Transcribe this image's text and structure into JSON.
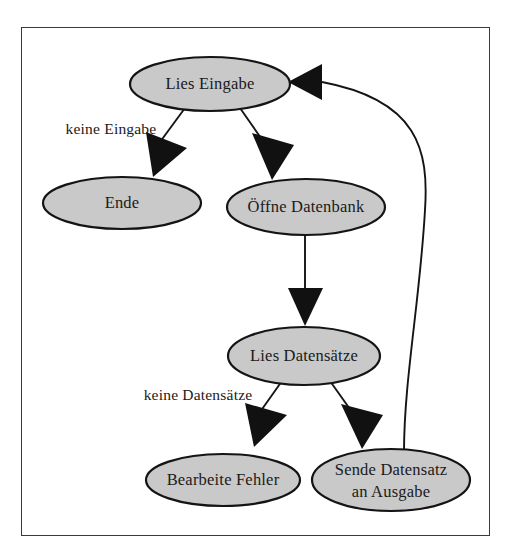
{
  "diagram": {
    "type": "flowchart",
    "language": "de",
    "frame": {
      "border_color": "#3a3a3a",
      "background": "#ffffff"
    },
    "style": {
      "node_fill": "#c9c9c9",
      "node_stroke": "#141414",
      "edge_color": "#141414",
      "text_color": "#1a1a1a"
    },
    "nodes": [
      {
        "id": "lies-eingabe",
        "label": "Lies Eingabe",
        "cx": 210,
        "cy": 84,
        "rx": 80,
        "ry": 27
      },
      {
        "id": "ende",
        "label": "Ende",
        "cx": 122,
        "cy": 203,
        "rx": 79,
        "ry": 26
      },
      {
        "id": "oeffne-datenbank",
        "label": "Öffne Datenbank",
        "cx": 306,
        "cy": 207,
        "rx": 79,
        "ry": 28
      },
      {
        "id": "lies-datensaetze",
        "label": "Lies Datensätze",
        "cx": 304,
        "cy": 356,
        "rx": 76,
        "ry": 29
      },
      {
        "id": "bearbeite-fehler",
        "label": "Bearbeite Fehler",
        "cx": 223,
        "cy": 480,
        "rx": 77,
        "ry": 26
      },
      {
        "id": "sende-datensatz",
        "label_line1": "Sende Datensatz",
        "label_line2": "an Ausgabe",
        "cx": 391,
        "cy": 480,
        "rx": 79,
        "ry": 31
      }
    ],
    "edges": [
      {
        "id": "edge-lies-eingabe-to-ende",
        "from": "lies-eingabe",
        "to": "ende",
        "label": "keine Eingabe"
      },
      {
        "id": "edge-lies-eingabe-to-oeffne-datenbank",
        "from": "lies-eingabe",
        "to": "oeffne-datenbank",
        "label": ""
      },
      {
        "id": "edge-oeffne-datenbank-to-lies-datensaetze",
        "from": "oeffne-datenbank",
        "to": "lies-datensaetze",
        "label": ""
      },
      {
        "id": "edge-lies-datensaetze-to-bearbeite-fehler",
        "from": "lies-datensaetze",
        "to": "bearbeite-fehler",
        "label": "keine Datensätze"
      },
      {
        "id": "edge-lies-datensaetze-to-sende-datensatz",
        "from": "lies-datensaetze",
        "to": "sende-datensatz",
        "label": ""
      },
      {
        "id": "edge-sende-datensatz-to-lies-eingabe",
        "from": "sende-datensatz",
        "to": "lies-eingabe",
        "label": ""
      }
    ],
    "edge_labels": [
      {
        "id": "label-keine-eingabe",
        "text": "keine Eingabe",
        "x": 111,
        "y": 130
      },
      {
        "id": "label-keine-datensaetze",
        "text": "keine Datensätze",
        "x": 198,
        "y": 396
      }
    ]
  }
}
